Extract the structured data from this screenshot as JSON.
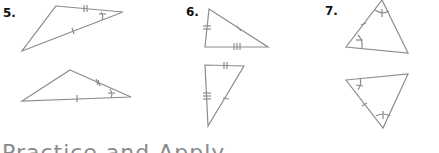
{
  "problems": [
    {
      "number": "5.",
      "description": "Two triangles with one side marked single tick, one side marked double tick, and one angle marked with arc and tick"
    },
    {
      "number": "6.",
      "description": "Two triangles with sides marked single, double, and triple ticks"
    },
    {
      "number": "7.",
      "description": "Two triangles with two angles marked with arcs and one included side marked single tick"
    }
  ],
  "colors": {
    "line": "#8c8c8c",
    "text": "#111111",
    "heading": "#8a8a8a"
  },
  "heading": {
    "text": "Practice and Apply"
  }
}
